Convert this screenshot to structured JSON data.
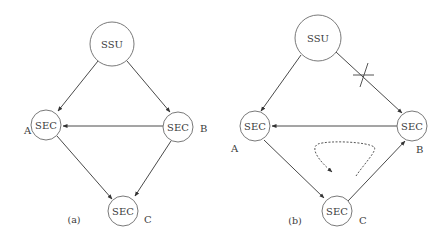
{
  "figure": {
    "panels": [
      {
        "id": "a",
        "caption": "(a)",
        "nodes": [
          {
            "id": "SSU",
            "label": "SSU",
            "side_label": ""
          },
          {
            "id": "A",
            "label": "SEC",
            "side_label": "A"
          },
          {
            "id": "B",
            "label": "SEC",
            "side_label": "B"
          },
          {
            "id": "C",
            "label": "SEC",
            "side_label": "C"
          }
        ],
        "edges": [
          {
            "from": "SSU",
            "to": "A",
            "broken": false
          },
          {
            "from": "SSU",
            "to": "B",
            "broken": false
          },
          {
            "from": "B",
            "to": "A",
            "broken": false
          },
          {
            "from": "A",
            "to": "C",
            "broken": false
          },
          {
            "from": "B",
            "to": "C",
            "broken": false
          }
        ]
      },
      {
        "id": "b",
        "caption": "(b)",
        "nodes": [
          {
            "id": "SSU",
            "label": "SSU",
            "side_label": ""
          },
          {
            "id": "A",
            "label": "SEC",
            "side_label": "A"
          },
          {
            "id": "B",
            "label": "SEC",
            "side_label": "B"
          },
          {
            "id": "C",
            "label": "SEC",
            "side_label": "C"
          }
        ],
        "edges": [
          {
            "from": "SSU",
            "to": "A",
            "broken": false
          },
          {
            "from": "SSU",
            "to": "B",
            "broken": true
          },
          {
            "from": "B",
            "to": "A",
            "broken": false
          },
          {
            "from": "A",
            "to": "C",
            "broken": false
          },
          {
            "from": "C",
            "to": "B",
            "broken": false
          }
        ],
        "annotations": {
          "failure_mark": "cross-mark",
          "timing_loop": "dashed-loop-arrow"
        }
      }
    ]
  }
}
